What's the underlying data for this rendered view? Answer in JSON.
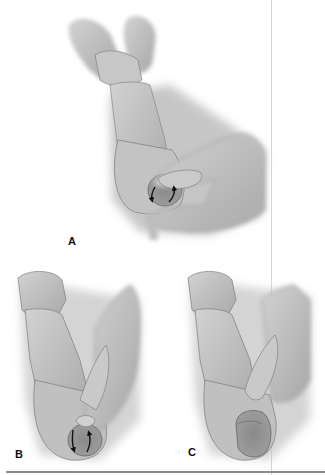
{
  "figure": {
    "panels": [
      {
        "id": "A",
        "label": "A",
        "description": "Two fingers hold glans upward while other hand's thumb rotates testis in scrotum",
        "arrows": "rotation arrows (clockwise/counter)"
      },
      {
        "id": "B",
        "label": "B",
        "description": "Thumb presses on testis at bottom of scrotum with rotation arrows",
        "arrows": "rotation arrows"
      },
      {
        "id": "C",
        "label": "C",
        "description": "Testis descended in lower scrotum, finger above"
      }
    ],
    "colors": {
      "background": "#ffffff",
      "skin_light": "#cfcfcf",
      "skin_mid": "#b5b5b5",
      "skin_dark": "#8f8f8f",
      "outline": "#6f6f6f",
      "arrow": "#111111",
      "rule_line": "#8a8a8a",
      "divider": "#d6d6d6"
    }
  }
}
